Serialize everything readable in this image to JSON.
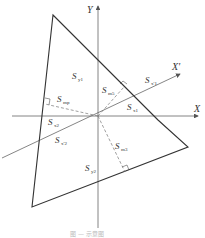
{
  "diagram": {
    "axes": {
      "x_label": "X",
      "y_label": "Y",
      "x_rot_label": "X'"
    },
    "colors": {
      "line": "#333333",
      "axis": "#666666",
      "dashed": "#777777"
    },
    "labels": [
      {
        "id": "sy1",
        "base": "S",
        "sub": "y1"
      },
      {
        "id": "smp",
        "base": "S",
        "sub": "mp"
      },
      {
        "id": "sm5",
        "base": "S",
        "sub": "m5"
      },
      {
        "id": "sx1p",
        "base": "S",
        "sub": "x'1"
      },
      {
        "id": "sx1",
        "base": "S",
        "sub": "x1"
      },
      {
        "id": "sx2",
        "base": "S",
        "sub": "x2"
      },
      {
        "id": "sx2p",
        "base": "S",
        "sub": "x'2"
      },
      {
        "id": "sm3",
        "base": "S",
        "sub": "m3"
      },
      {
        "id": "sy2",
        "base": "S",
        "sub": "y2"
      }
    ],
    "caption": "图 — 示意图"
  }
}
